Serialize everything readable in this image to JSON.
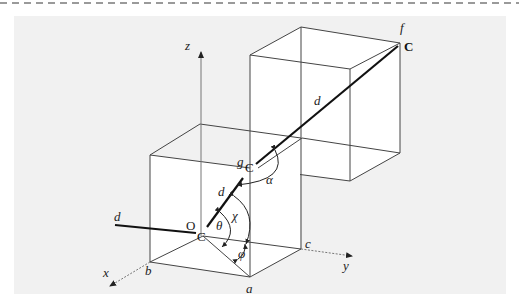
{
  "figure": {
    "type": "3D cube diagram with dihedral/bond angles",
    "axes": {
      "x": "x",
      "y": "y",
      "z": "z"
    },
    "vertices": {
      "a": "a",
      "b": "b",
      "c": "c",
      "f": "f",
      "g": "g"
    },
    "atoms": {
      "origin_label": "O",
      "atom_origin": "C",
      "atom_g": "C",
      "atom_f": "C"
    },
    "bonds": {
      "d_left": "d",
      "d_lower": "d",
      "d_upper": "d"
    },
    "angles": {
      "theta": "θ",
      "chi": "χ",
      "phi": "φ",
      "alpha": "α"
    }
  },
  "colors": {
    "background_panel": "#f1f1f1",
    "line": "#333333",
    "axis": "#777777",
    "page": "#ffffff"
  }
}
